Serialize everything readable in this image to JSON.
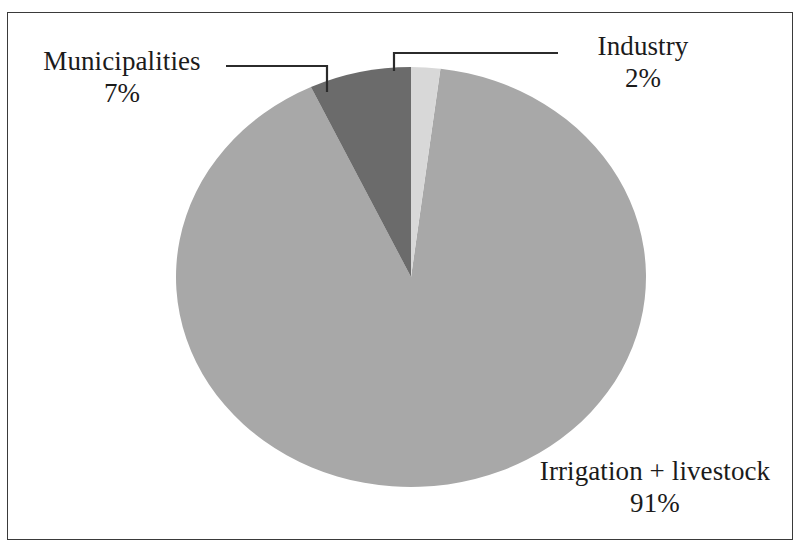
{
  "figure": {
    "background_color": "#ffffff",
    "frame_color": "#3a3a3a",
    "text_color": "#1b1b1b"
  },
  "chart_data": {
    "type": "pie",
    "title": "",
    "subtitle": "",
    "xlabel": "",
    "ylabel": "",
    "legend_position": "none",
    "grid": false,
    "labels_outside": true,
    "leader_lines": true,
    "start_angle_deg": 0,
    "direction": "clockwise",
    "unit": "%",
    "categories": [
      "Industry",
      "Irrigation + livestock",
      "Municipalities"
    ],
    "values": [
      2,
      91,
      7
    ],
    "colors": [
      "#d8d8d8",
      "#a8a8a8",
      "#6b6b6b"
    ],
    "slices": [
      {
        "name": "Industry",
        "label": "Industry",
        "value": 2,
        "value_label": "2%",
        "color": "#d8d8d8",
        "start_angle_deg": 0,
        "end_angle_deg": 7.2
      },
      {
        "name": "Irrigation + livestock",
        "label": "Irrigation + livestock",
        "value": 91,
        "value_label": "91%",
        "color": "#a8a8a8",
        "start_angle_deg": 7.2,
        "end_angle_deg": 334.8
      },
      {
        "name": "Municipalities",
        "label": "Municipalities",
        "value": 7,
        "value_label": "7%",
        "color": "#6b6b6b",
        "start_angle_deg": 334.8,
        "end_angle_deg": 360
      }
    ]
  },
  "labels": {
    "municipalities": {
      "name": "Municipalities",
      "value": "7%"
    },
    "industry": {
      "name": "Industry",
      "value": "2%"
    },
    "irrigation": {
      "name": "Irrigation + livestock",
      "value": "91%"
    }
  }
}
